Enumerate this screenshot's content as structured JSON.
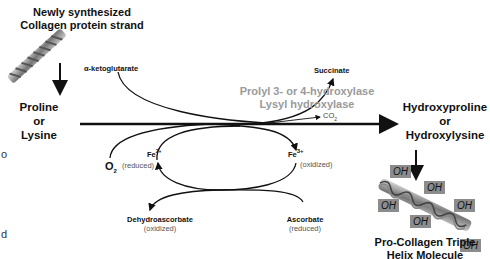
{
  "diagram": {
    "title_top": [
      "Newly synthesized",
      "Collagen protein strand"
    ],
    "substrate": [
      "Proline",
      "or",
      "Lysine"
    ],
    "product": [
      "Hydroxyproline",
      "or",
      "Hydroxylysine"
    ],
    "enzyme": [
      "Prolyl 3- or 4-hydroxylase",
      "Lysyl hydroxylase"
    ],
    "cosubstrate_in": "α-ketoglutarate",
    "cosubstrate_out": "Succinate",
    "co2": "CO",
    "co2_sub": "2",
    "o2": "O",
    "o2_sub": "2",
    "fe2": "Fe",
    "fe2_sup": "2+",
    "fe2_state": "(reduced)",
    "fe3": "Fe",
    "fe3_sup": "3+",
    "fe3_state": "(oxidized)",
    "dehydro": "Dehydroascorbate",
    "dehydro_state": "(oxidized)",
    "ascorbate": "Ascorbate",
    "ascorbate_state": "(reduced)",
    "final_product": [
      "Pro-Collagen Triple",
      "Helix Molecule"
    ],
    "oh_label": "OH",
    "edge_chars": [
      "o",
      "d"
    ]
  },
  "colors": {
    "enzyme_text": "#9a9a9a",
    "oh_box": "#8c8c8c",
    "lines": "#111111"
  }
}
